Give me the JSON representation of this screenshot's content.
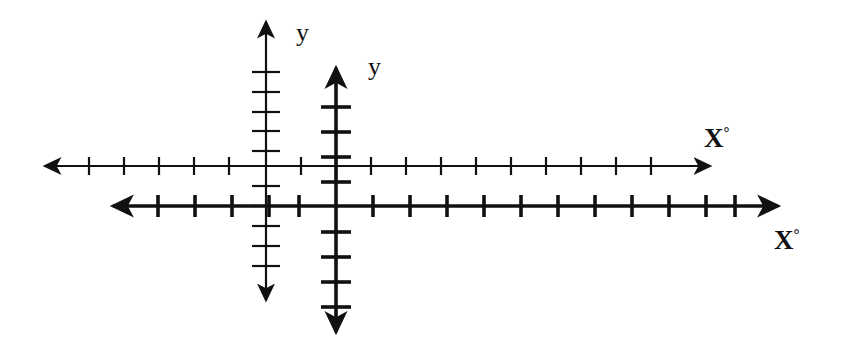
{
  "figure": {
    "background_color": "#ffffff",
    "stroke_color": "#111111",
    "width": 841,
    "height": 350,
    "labels": {
      "x_primary": "X",
      "x_primary_degree": "°",
      "x_secondary": "X",
      "x_secondary_degree": "°",
      "y_primary": "y",
      "y_secondary": "y"
    }
  },
  "chart_data": {
    "type": "line",
    "title": "",
    "subtitle": "",
    "xlabel": "X°",
    "ylabel": "y",
    "grid": false,
    "legend": null,
    "annotations": [
      {
        "text": "X°",
        "x": 710,
        "y": 138,
        "system": "primary"
      },
      {
        "text": "X°",
        "x": 786,
        "y": 240,
        "system": "secondary"
      },
      {
        "text": "y",
        "x": 302,
        "y": 34,
        "system": "primary"
      },
      {
        "text": "y",
        "x": 374,
        "y": 68,
        "system": "secondary"
      }
    ],
    "series": [
      {
        "name": "primary-axis-system",
        "stroke_width": 2.2,
        "origin": {
          "x": 266,
          "y": 166
        },
        "x_axis": {
          "y": 166,
          "x_start": 45,
          "x_end": 710,
          "arrow_start": true,
          "arrow_end": true,
          "tick_spacing": 35,
          "tick_half_length": 9,
          "ticks": [
            89,
            124,
            159,
            194,
            229,
            301,
            336,
            371,
            406,
            441,
            476,
            511,
            546,
            581,
            616,
            651
          ]
        },
        "y_axis": {
          "x": 266,
          "y_start": 22,
          "y_end": 300,
          "arrow_start": true,
          "arrow_end": true,
          "tick_spacing": 20,
          "tick_half_length": 14,
          "ticks": [
            72,
            92,
            112,
            131,
            151,
            186,
            206,
            226,
            246,
            266
          ]
        }
      },
      {
        "name": "secondary-axis-system",
        "stroke_width": 3.6,
        "origin": {
          "x": 336,
          "y": 206
        },
        "x_axis": {
          "y": 206,
          "x_start": 113,
          "x_end": 778,
          "arrow_start": true,
          "arrow_end": true,
          "tick_spacing": 37,
          "tick_half_length": 11,
          "ticks": [
            158,
            195,
            232,
            269,
            299,
            373,
            410,
            447,
            484,
            521,
            558,
            595,
            632,
            669,
            706,
            735
          ]
        },
        "y_axis": {
          "x": 336,
          "y_start": 68,
          "y_end": 332,
          "arrow_start": true,
          "arrow_end": true,
          "tick_spacing": 25,
          "tick_half_length": 15,
          "ticks": [
            107,
            132,
            157,
            182,
            232,
            257,
            282,
            307
          ]
        }
      }
    ]
  }
}
